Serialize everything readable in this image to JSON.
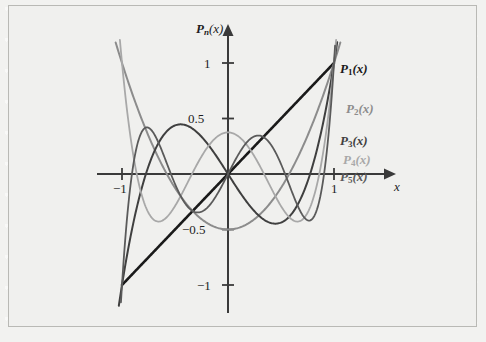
{
  "figure": {
    "background_color": "#f0f0ee",
    "border_color": "#b9b9b5",
    "axis_color": "#3a3a3a"
  },
  "axes": {
    "y_axis_label": "Pn(x)",
    "y_axis_label_parts": {
      "base": "P",
      "sub": "n",
      "arg": "(x)"
    },
    "x_axis_label": "x",
    "x_ticks": [
      {
        "value": -1,
        "label": "−1",
        "px": 122
      },
      {
        "value": 1,
        "label": "1",
        "px": 334
      }
    ],
    "y_ticks": [
      {
        "value": 1,
        "label": "1",
        "px": 63
      },
      {
        "value": 0.5,
        "label": "0.5",
        "px": 118.5
      },
      {
        "value": -0.5,
        "label": "−0.5",
        "px": 229.5
      },
      {
        "value": -1,
        "label": "−1",
        "px": 285
      }
    ],
    "origin": {
      "x": 228,
      "y": 174
    },
    "unit_x_px": 106,
    "unit_y_px": 111,
    "xlim": [
      -1.12,
      1.5
    ],
    "ylim": [
      -1.25,
      1.25
    ]
  },
  "chart_data": {
    "type": "line",
    "title": "",
    "xlabel": "x",
    "ylabel": "Pn(x)",
    "xlim": [
      -1,
      1
    ],
    "ylim": [
      -1,
      1
    ],
    "grid": false,
    "legend": "inline-right-of-curves",
    "x_ticks": [
      -1,
      1
    ],
    "y_ticks": [
      -1,
      -0.5,
      0.5,
      1
    ],
    "series": [
      {
        "name": "P1(x)",
        "label_parts": {
          "base": "P",
          "sub": "1",
          "arg": "(x)"
        },
        "color": "#1a1a1a",
        "width": 2.6,
        "degree": 1,
        "coeffs": [
          0,
          1
        ],
        "label_pos": {
          "x": 340,
          "y": 62
        },
        "domain": [
          -1,
          1
        ],
        "points": [
          {
            "x": -1,
            "y": -1
          },
          {
            "x": -0.5,
            "y": -0.5
          },
          {
            "x": 0,
            "y": 0
          },
          {
            "x": 0.5,
            "y": 0.5
          },
          {
            "x": 1,
            "y": 1
          }
        ]
      },
      {
        "name": "P2(x)",
        "label_parts": {
          "base": "P",
          "sub": "2",
          "arg": "(x)"
        },
        "color": "#8c8c8c",
        "width": 2.0,
        "degree": 2,
        "coeffs": [
          -0.5,
          0,
          1.5
        ],
        "label_pos": {
          "x": 346,
          "y": 102
        },
        "domain": [
          -1.06,
          1.06
        ],
        "points": [
          {
            "x": -1,
            "y": 1
          },
          {
            "x": -0.75,
            "y": 0.3438
          },
          {
            "x": -0.5,
            "y": -0.125
          },
          {
            "x": -0.25,
            "y": -0.4063
          },
          {
            "x": 0,
            "y": -0.5
          },
          {
            "x": 0.25,
            "y": -0.4063
          },
          {
            "x": 0.5,
            "y": -0.125
          },
          {
            "x": 0.75,
            "y": 0.3438
          },
          {
            "x": 1,
            "y": 1
          }
        ]
      },
      {
        "name": "P3(x)",
        "label_parts": {
          "base": "P",
          "sub": "3",
          "arg": "(x)"
        },
        "color": "#3f3f3f",
        "width": 2.0,
        "degree": 3,
        "coeffs": [
          0,
          -1.5,
          0,
          2.5
        ],
        "label_pos": {
          "x": 340,
          "y": 134
        },
        "domain": [
          -1.03,
          1.03
        ],
        "points": [
          {
            "x": -1,
            "y": -1
          },
          {
            "x": -0.75,
            "y": 0.0703
          },
          {
            "x": -0.5,
            "y": 0.4375
          },
          {
            "x": -0.25,
            "y": 0.3359
          },
          {
            "x": 0,
            "y": 0
          },
          {
            "x": 0.25,
            "y": -0.3359
          },
          {
            "x": 0.5,
            "y": -0.4375
          },
          {
            "x": 0.75,
            "y": -0.0703
          },
          {
            "x": 1,
            "y": 1
          }
        ]
      },
      {
        "name": "P4(x)",
        "label_parts": {
          "base": "P",
          "sub": "4",
          "arg": "(x)"
        },
        "color": "#a8a8a8",
        "width": 1.8,
        "degree": 4,
        "coeffs": [
          0.375,
          0,
          -3.75,
          0,
          4.375
        ],
        "label_pos": {
          "x": 343,
          "y": 153
        },
        "domain": [
          -1.02,
          1.02
        ],
        "points": [
          {
            "x": -1,
            "y": 1
          },
          {
            "x": -0.75,
            "y": -0.2334
          },
          {
            "x": -0.5,
            "y": -0.2891
          },
          {
            "x": -0.25,
            "y": 0.1309
          },
          {
            "x": 0,
            "y": 0.375
          },
          {
            "x": 0.25,
            "y": 0.1309
          },
          {
            "x": 0.5,
            "y": -0.2891
          },
          {
            "x": 0.75,
            "y": -0.2334
          },
          {
            "x": 1,
            "y": 1
          }
        ]
      },
      {
        "name": "P5(x)",
        "label_parts": {
          "base": "P",
          "sub": "5",
          "arg": "(x)"
        },
        "color": "#5a5a5a",
        "width": 1.8,
        "degree": 5,
        "coeffs": [
          0,
          1.875,
          0,
          -8.75,
          0,
          7.875
        ],
        "label_pos": {
          "x": 340,
          "y": 170
        },
        "domain": [
          -1.01,
          1.01
        ],
        "points": [
          {
            "x": -1,
            "y": -1
          },
          {
            "x": -0.75,
            "y": 0.3647
          },
          {
            "x": -0.5,
            "y": -0.0898
          },
          {
            "x": -0.25,
            "y": -0.3351
          },
          {
            "x": 0,
            "y": 0
          },
          {
            "x": 0.25,
            "y": 0.3351
          },
          {
            "x": 0.5,
            "y": 0.0898
          },
          {
            "x": 0.75,
            "y": -0.3647
          },
          {
            "x": 1,
            "y": 1
          }
        ]
      }
    ]
  }
}
